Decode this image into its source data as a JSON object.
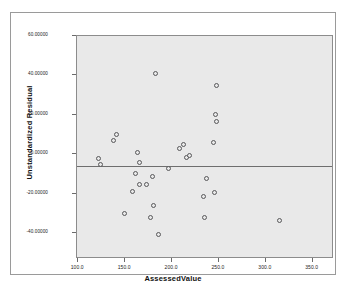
{
  "chart_data": {
    "type": "scatter",
    "title": "",
    "xlabel": "AssessedValue",
    "ylabel": "Unstandardized Residual",
    "xlim": [
      88,
      362
    ],
    "ylim": [
      -47,
      66
    ],
    "xticks": [
      "100.0",
      "150.0",
      "200.0",
      "250.0",
      "300.0",
      "350.0"
    ],
    "xtick_values": [
      100,
      150,
      200,
      250,
      300,
      350
    ],
    "yticks": [
      "60.00000",
      "40.00000",
      "20.00000",
      "0.00000",
      "-20.00000",
      "-40.00000"
    ],
    "ytick_values": [
      60,
      40,
      20,
      0,
      -20,
      -40
    ],
    "grid": false,
    "legend": false,
    "reference_line_y": 0,
    "marker": "open-circle",
    "marker_color": "#58585a",
    "panel_color": "#e9e9e9",
    "points": [
      {
        "x": 111,
        "y": 4.0
      },
      {
        "x": 113,
        "y": 1.0
      },
      {
        "x": 127,
        "y": 13.0
      },
      {
        "x": 130,
        "y": 16.0
      },
      {
        "x": 139,
        "y": -24.0
      },
      {
        "x": 147,
        "y": -13.0
      },
      {
        "x": 150,
        "y": -3.5
      },
      {
        "x": 153,
        "y": 7.0
      },
      {
        "x": 155,
        "y": 1.8
      },
      {
        "x": 155,
        "y": -9.5
      },
      {
        "x": 162,
        "y": -9.0
      },
      {
        "x": 166,
        "y": -26.0
      },
      {
        "x": 168,
        "y": -5.0
      },
      {
        "x": 170,
        "y": -20.0
      },
      {
        "x": 172,
        "y": 47.0
      },
      {
        "x": 175,
        "y": -34.5
      },
      {
        "x": 186,
        "y": -1.0
      },
      {
        "x": 197,
        "y": 9.0
      },
      {
        "x": 202,
        "y": 11.0
      },
      {
        "x": 205,
        "y": 4.5
      },
      {
        "x": 208,
        "y": 5.5
      },
      {
        "x": 223,
        "y": -15.5
      },
      {
        "x": 224,
        "y": -26.0
      },
      {
        "x": 226,
        "y": -6.0
      },
      {
        "x": 234,
        "y": 12.0
      },
      {
        "x": 235,
        "y": -13.5
      },
      {
        "x": 236,
        "y": 26.0
      },
      {
        "x": 237,
        "y": 22.5
      },
      {
        "x": 237,
        "y": 41.0
      },
      {
        "x": 304,
        "y": -27.5
      }
    ]
  }
}
